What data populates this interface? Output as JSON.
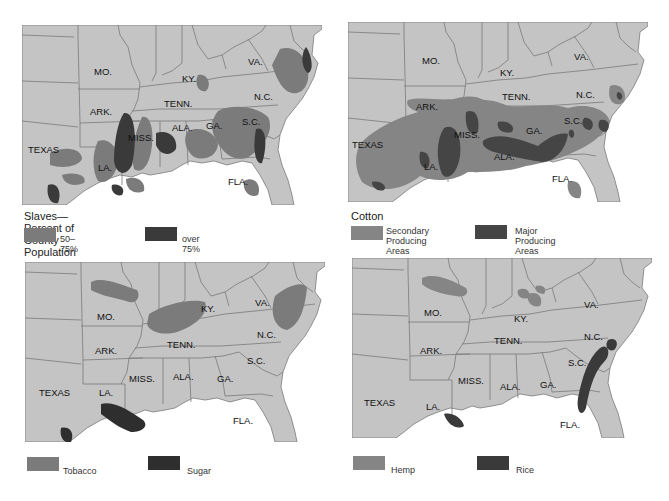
{
  "colors": {
    "land": "#c4c4c4",
    "border": "#7a7a7a",
    "water": "#ffffff",
    "medium": "#7b7b7b",
    "dark": "#3a3a3a"
  },
  "state_labels": {
    "mo": "MO.",
    "ky": "KY.",
    "va": "VA.",
    "ark": "ARK.",
    "tenn": "TENN.",
    "nc": "N.C.",
    "texas": "TEXAS",
    "miss": "MISS.",
    "ala": "ALA.",
    "ga": "GA.",
    "sc": "S.C.",
    "la": "LA.",
    "fla": "FLA."
  },
  "maps": [
    {
      "id": "slaves",
      "legend_title": "Slaves—Percent of County Population",
      "legend": [
        {
          "label": "50–75%",
          "color": "#7b7b7b"
        },
        {
          "label": "over 75%",
          "color": "#3a3a3a"
        }
      ]
    },
    {
      "id": "cotton",
      "legend_title": "Cotton",
      "legend": [
        {
          "label_line1": "Secondary",
          "label_line2": "Producing Areas",
          "color": "#858585"
        },
        {
          "label_line1": "Major",
          "label_line2": "Producing Areas",
          "color": "#454545"
        }
      ]
    },
    {
      "id": "tobacco-sugar",
      "legend_title": "",
      "legend": [
        {
          "label": "Tobacco",
          "color": "#7b7b7b"
        },
        {
          "label": "Sugar",
          "color": "#2e2e2e"
        }
      ]
    },
    {
      "id": "hemp-rice",
      "legend_title": "",
      "legend": [
        {
          "label": "Hemp",
          "color": "#858585"
        },
        {
          "label": "Rice",
          "color": "#3a3a3a"
        }
      ]
    }
  ]
}
